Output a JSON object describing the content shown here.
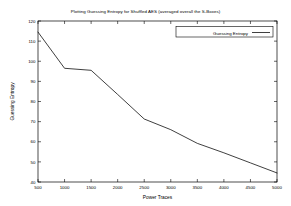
{
  "chart_data": {
    "type": "line",
    "title": "Plotting Guessing Entropy for Shuffled AES (averaged overall the S-Boxes)",
    "xlabel": "Power Traces",
    "ylabel": "Guessing Entropy",
    "xlim": [
      500,
      5000
    ],
    "ylim": [
      40,
      120
    ],
    "grid": false,
    "legend_position": "top-right-inside",
    "xticks": [
      500,
      1000,
      1500,
      2000,
      2500,
      3000,
      3500,
      4000,
      4500,
      5000
    ],
    "xtick_labels": [
      "500",
      "1000",
      "1500",
      "2000",
      "2500",
      "3000",
      "3500",
      "4000",
      "4500",
      "5000"
    ],
    "yticks": [
      40,
      50,
      60,
      70,
      80,
      90,
      100,
      110,
      120
    ],
    "ytick_labels": [
      "40",
      "50",
      "60",
      "70",
      "80",
      "90",
      "100",
      "110",
      "120"
    ],
    "x": [
      500,
      1000,
      1500,
      2000,
      2500,
      3000,
      3500,
      4000,
      4500,
      5000
    ],
    "series": [
      {
        "name": "Guessing Entropy",
        "color": "#000000",
        "values": [
          114.5,
          96.5,
          95.5,
          83.5,
          71.3,
          66.0,
          59.2,
          54.5,
          49.5,
          44.5
        ]
      }
    ]
  },
  "legend": {
    "entries": [
      {
        "label": "Guessing Entropy"
      }
    ]
  }
}
